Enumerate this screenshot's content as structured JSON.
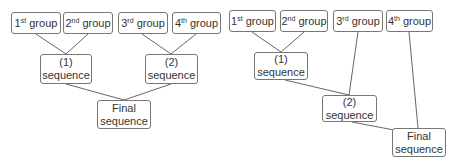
{
  "diagrams": [
    {
      "groups": [
        {
          "num": "1",
          "sup": "st",
          "label": "group"
        },
        {
          "num": "2",
          "sup": "nd",
          "label": "group"
        },
        {
          "num": "3",
          "sup": "rd",
          "label": "group"
        },
        {
          "num": "4",
          "sup": "th",
          "label": "group"
        }
      ],
      "seq1": {
        "line1": "(1)",
        "line2": "sequence"
      },
      "seq2": {
        "line1": "(2)",
        "line2": "sequence"
      },
      "final": {
        "line1": "Final",
        "line2": "sequence"
      }
    },
    {
      "groups": [
        {
          "num": "1",
          "sup": "st",
          "label": "group"
        },
        {
          "num": "2",
          "sup": "nd",
          "label": "group"
        },
        {
          "num": "3",
          "sup": "rd",
          "label": "group"
        },
        {
          "num": "4",
          "sup": "th",
          "label": "group"
        }
      ],
      "seq1": {
        "line1": "(1)",
        "line2": "sequence"
      },
      "seq2": {
        "line1": "(2)",
        "line2": "sequence"
      },
      "final": {
        "line1": "Final",
        "line2": "sequence"
      }
    }
  ],
  "colors": {
    "line": "#555555",
    "border": "#777777"
  }
}
